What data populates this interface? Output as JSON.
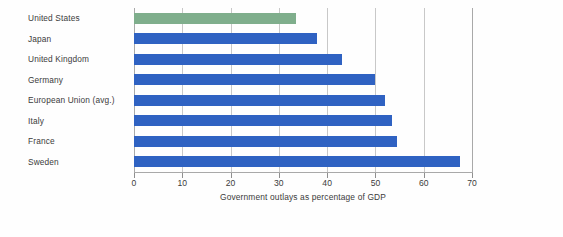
{
  "chart_data": {
    "type": "bar",
    "orientation": "horizontal",
    "title": "",
    "xlabel": "Government outlays as percentage of GDP",
    "ylabel": "",
    "xlim": [
      0,
      70
    ],
    "xticks": [
      0,
      10,
      20,
      30,
      40,
      50,
      60,
      70
    ],
    "xtick_labels": [
      "0",
      "10",
      "20",
      "30",
      "40",
      "50",
      "60",
      "70"
    ],
    "grid": "vertical",
    "legend": "none",
    "categories": [
      "United States",
      "Japan",
      "United Kingdom",
      "Germany",
      "European Union (avg.)",
      "Italy",
      "France",
      "Sweden"
    ],
    "values": [
      33.5,
      38,
      43,
      50,
      52,
      53.5,
      54.5,
      67.5
    ],
    "bar_colors": [
      "#7FAE8C",
      "#2F62C2",
      "#2F62C2",
      "#2F62C2",
      "#2F62C2",
      "#2F62C2",
      "#2F62C2",
      "#2F62C2"
    ],
    "highlight_category": "United States",
    "colors": {
      "bar_blue": "#2F62C2",
      "bar_green": "#7FAE8C",
      "gridline": "#c8c8c8",
      "axis": "#a9a9a9",
      "text": "#3b3b3b",
      "background": "#fefefe"
    }
  }
}
